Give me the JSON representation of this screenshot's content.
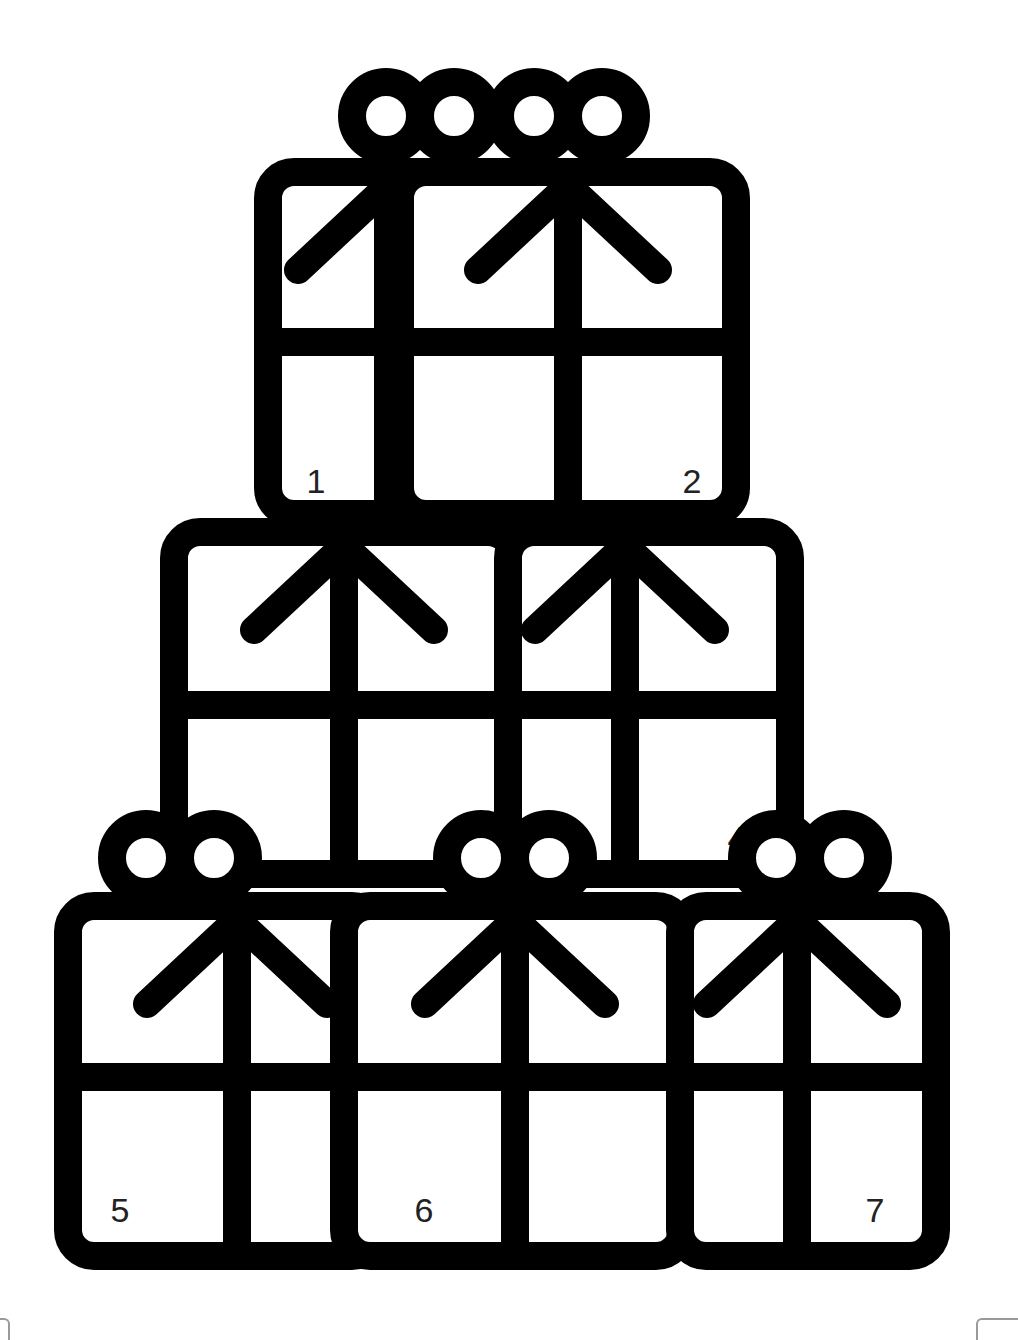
{
  "colors": {
    "ink": "#000000",
    "paper": "#ffffff",
    "label": "#222222"
  },
  "stroke_width": 28,
  "boxes": [
    {
      "id": 1,
      "label": "1",
      "x": 268,
      "y": 172,
      "w": 260,
      "h": 342,
      "ribbon_x": 388,
      "ribbon_y": 342,
      "label_x": 316,
      "label_y": 493,
      "bow": true,
      "bow_cx": 420,
      "bow_cy": 116
    },
    {
      "id": 2,
      "label": "2",
      "x": 400,
      "y": 172,
      "w": 336,
      "h": 342,
      "ribbon_x": 568,
      "ribbon_y": 342,
      "label_x": 692,
      "label_y": 493,
      "bow": true,
      "bow_cx": 568,
      "bow_cy": 116
    },
    {
      "id": 3,
      "label": "3",
      "x": 174,
      "y": 532,
      "w": 340,
      "h": 342,
      "ribbon_x": 344,
      "ribbon_y": 705,
      "label_x": 221,
      "label_y": 850,
      "bow": false
    },
    {
      "id": 4,
      "label": "4",
      "x": 508,
      "y": 532,
      "w": 282,
      "h": 342,
      "ribbon_x": 625,
      "ribbon_y": 705,
      "label_x": 737,
      "label_y": 850,
      "bow": false
    },
    {
      "id": 5,
      "label": "5",
      "x": 68,
      "y": 906,
      "w": 310,
      "h": 350,
      "ribbon_x": 237,
      "ribbon_y": 1077,
      "label_x": 120,
      "label_y": 1222,
      "bow": true,
      "bow_cx": 180,
      "bow_cy": 858
    },
    {
      "id": 6,
      "label": "6",
      "x": 344,
      "y": 906,
      "w": 338,
      "h": 350,
      "ribbon_x": 515,
      "ribbon_y": 1077,
      "label_x": 424,
      "label_y": 1222,
      "bow": true,
      "bow_cx": 515,
      "bow_cy": 858
    },
    {
      "id": 7,
      "label": "7",
      "x": 680,
      "y": 906,
      "w": 256,
      "h": 350,
      "ribbon_x": 797,
      "ribbon_y": 1077,
      "label_x": 875,
      "label_y": 1222,
      "bow": true,
      "bow_cx": 810,
      "bow_cy": 858
    }
  ],
  "label_font_size": 34
}
